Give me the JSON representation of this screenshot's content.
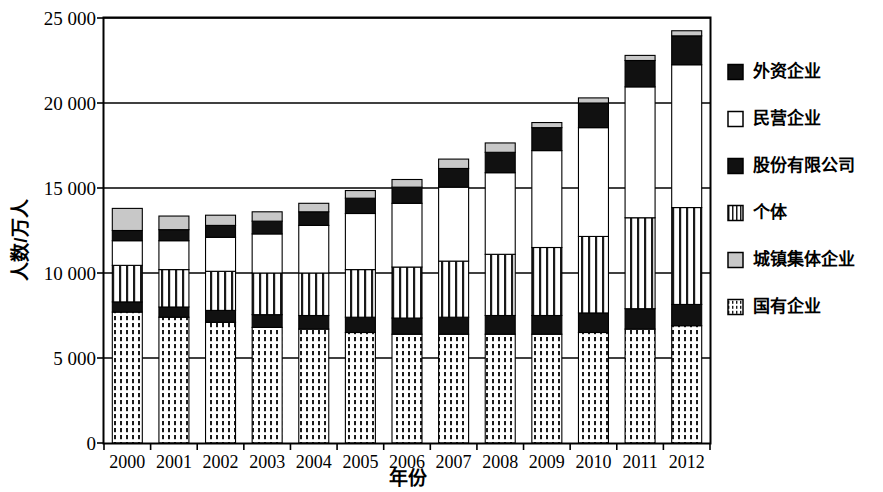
{
  "chart_data": {
    "type": "bar",
    "subtype": "stacked-bar",
    "title": "",
    "xlabel": "年份",
    "ylabel": "人数/万人",
    "categories": [
      "2000",
      "2001",
      "2002",
      "2003",
      "2004",
      "2005",
      "2006",
      "2007",
      "2008",
      "2009",
      "2010",
      "2011",
      "2012"
    ],
    "ylim": [
      0,
      25000
    ],
    "yticks": [
      0,
      5000,
      10000,
      15000,
      20000,
      25000
    ],
    "ytick_labels": [
      "0",
      "5 000",
      "10 000",
      "15 000",
      "20 000",
      "25 000"
    ],
    "grid": true,
    "legend_position": "right",
    "stack_order_bottom_to_top": [
      "国有企业",
      "股份有限公司",
      "个体",
      "民营企业",
      "外资企业",
      "城镇集体企业"
    ],
    "series": [
      {
        "name": "国有企业",
        "pattern": "dashed-grid",
        "fill": "#ffffff",
        "values": [
          7700,
          7400,
          7100,
          6800,
          6700,
          6500,
          6400,
          6400,
          6400,
          6400,
          6500,
          6700,
          6900
        ]
      },
      {
        "name": "股份有限公司",
        "pattern": "solid",
        "fill": "#111111",
        "values": [
          600,
          600,
          700,
          750,
          800,
          900,
          950,
          1000,
          1100,
          1100,
          1150,
          1200,
          1250
        ]
      },
      {
        "name": "个体",
        "pattern": "vertical-stripes",
        "fill": "#ffffff",
        "values": [
          2150,
          2200,
          2300,
          2450,
          2500,
          2800,
          3000,
          3300,
          3600,
          4000,
          4500,
          5350,
          5700
        ]
      },
      {
        "name": "民营企业",
        "pattern": "none",
        "fill": "#ffffff",
        "values": [
          1450,
          1700,
          2000,
          2300,
          2800,
          3300,
          3750,
          4350,
          4800,
          5700,
          6400,
          7700,
          8400
        ]
      },
      {
        "name": "外资企业",
        "pattern": "solid",
        "fill": "#111111",
        "values": [
          600,
          650,
          700,
          750,
          800,
          900,
          950,
          1100,
          1200,
          1350,
          1450,
          1550,
          1700
        ]
      },
      {
        "name": "城镇集体企业",
        "pattern": "solid",
        "fill": "#c8c8c8",
        "values": [
          1300,
          800,
          600,
          550,
          500,
          450,
          450,
          550,
          550,
          300,
          300,
          300,
          300
        ]
      }
    ],
    "totals": [
      13800,
      13350,
      13400,
      13600,
      14100,
      14850,
      15500,
      16700,
      17650,
      18850,
      20300,
      22800,
      24250
    ]
  },
  "legend": {
    "items": [
      {
        "label": "外资企业",
        "swatch": "solid-black-swatch"
      },
      {
        "label": "民营企业",
        "swatch": "empty-white-swatch"
      },
      {
        "label": "股份有限公司",
        "swatch": "solid-black-swatch"
      },
      {
        "label": "个体",
        "swatch": "vertical-stripe-swatch"
      },
      {
        "label": "城镇集体企业",
        "swatch": "light-gray-swatch"
      },
      {
        "label": "国有企业",
        "swatch": "dashed-grid-swatch"
      }
    ]
  },
  "colors": {
    "axis": "#000000",
    "grid": "#000000",
    "black_fill": "#111111",
    "gray_fill": "#c8c8c8",
    "white_fill": "#ffffff"
  }
}
